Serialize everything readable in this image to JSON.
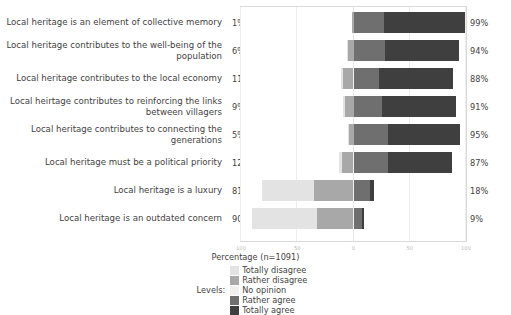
{
  "chart_data": {
    "type": "bar",
    "subtype": "diverging-stacked-likert",
    "title": "",
    "xlabel": "Percentage (n=1091)",
    "ylabel": "",
    "xlim": [
      -100,
      100
    ],
    "xticks": [
      "100",
      "50",
      "0",
      "50",
      "100"
    ],
    "grid": true,
    "legend_position": "bottom",
    "legend_title": "Levels:",
    "legend": [
      {
        "name": "Totally disagree",
        "color": "#e3e3e3"
      },
      {
        "name": "Rather disagree",
        "color": "#a8a8a8"
      },
      {
        "name": "No opinion",
        "color": "#f0f0f0"
      },
      {
        "name": "Rather agree",
        "color": "#6f6f6f"
      },
      {
        "name": "Totally agree",
        "color": "#3f3f3f"
      }
    ],
    "categories": [
      "Local heritage is an element of collective memory",
      "Local heritage contributes to the well-being of the population",
      "Local heritage contributes to the local economy",
      "Local heirtage contributes to reinforcing the links between villagers",
      "Local heritage contributes to connecting the generations",
      "Local heritage must be a political priority",
      "Local heritage is a luxury",
      "Local heritage is an outdated concern"
    ],
    "disagree_totals": [
      "1%",
      "6%",
      "11%",
      "9%",
      "5%",
      "12%",
      "81%",
      "90%"
    ],
    "agree_totals": [
      "99%",
      "94%",
      "88%",
      "91%",
      "95%",
      "87%",
      "18%",
      "9%"
    ],
    "series": [
      {
        "name": "Totally disagree",
        "values": [
          0,
          1,
          2,
          1,
          1,
          2,
          46,
          58
        ]
      },
      {
        "name": "Rather disagree",
        "values": [
          1,
          5,
          9,
          8,
          4,
          10,
          35,
          32
        ]
      },
      {
        "name": "No opinion",
        "values": [
          0,
          0,
          1,
          0,
          0,
          1,
          1,
          1
        ]
      },
      {
        "name": "Rather agree",
        "values": [
          27,
          28,
          22,
          25,
          31,
          30,
          14,
          7
        ]
      },
      {
        "name": "Totally agree",
        "values": [
          72,
          66,
          66,
          66,
          64,
          57,
          4,
          2
        ]
      }
    ]
  }
}
